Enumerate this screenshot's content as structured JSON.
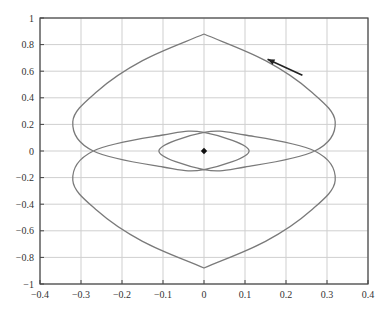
{
  "chart_data": {
    "type": "line",
    "title": "",
    "xlabel": "",
    "ylabel": "",
    "xlim": [
      -0.4,
      0.4
    ],
    "ylim": [
      -1,
      1
    ],
    "grid": true,
    "legend": null,
    "x_ticks": [
      "-0.4",
      "-0.3",
      "-0.2",
      "-0.1",
      "0",
      "0.1",
      "0.2",
      "0.3",
      "0.4"
    ],
    "y_ticks": [
      "1",
      "0.8",
      "0.6",
      "0.4",
      "0.2",
      "0",
      "-0.2",
      "-0.4",
      "-0.6",
      "-0.8",
      "-1"
    ],
    "series": [
      {
        "name": "trajectory",
        "description": "Closed phase-plane trajectory: upper lobe, lower lobe and inner ellipse around the origin",
        "points": [
          {
            "x": 0.0,
            "y": 0.88
          },
          {
            "x": 0.15,
            "y": 0.68
          },
          {
            "x": 0.26,
            "y": 0.45
          },
          {
            "x": 0.32,
            "y": 0.22
          },
          {
            "x": 0.27,
            "y": 0.0
          },
          {
            "x": 0.1,
            "y": -0.12
          },
          {
            "x": 0.0,
            "y": -0.14
          },
          {
            "x": -0.11,
            "y": 0.0
          },
          {
            "x": 0.0,
            "y": 0.14
          },
          {
            "x": 0.1,
            "y": 0.12
          },
          {
            "x": 0.27,
            "y": 0.0
          },
          {
            "x": 0.32,
            "y": -0.22
          },
          {
            "x": 0.26,
            "y": -0.45
          },
          {
            "x": 0.15,
            "y": -0.68
          },
          {
            "x": 0.0,
            "y": -0.88
          },
          {
            "x": -0.15,
            "y": -0.68
          },
          {
            "x": -0.26,
            "y": -0.45
          },
          {
            "x": -0.32,
            "y": -0.22
          },
          {
            "x": -0.27,
            "y": 0.0
          },
          {
            "x": -0.1,
            "y": 0.12
          },
          {
            "x": 0.0,
            "y": 0.14
          },
          {
            "x": 0.11,
            "y": 0.0
          },
          {
            "x": 0.0,
            "y": -0.14
          },
          {
            "x": -0.1,
            "y": -0.12
          },
          {
            "x": -0.27,
            "y": 0.0
          },
          {
            "x": -0.32,
            "y": 0.22
          },
          {
            "x": -0.26,
            "y": 0.45
          },
          {
            "x": -0.15,
            "y": 0.68
          },
          {
            "x": 0.0,
            "y": 0.88
          }
        ],
        "color": "#7a7a7a"
      }
    ],
    "annotations": [
      {
        "type": "marker",
        "shape": "diamond",
        "x": 0.0,
        "y": 0.0,
        "color": "#111111"
      },
      {
        "type": "arrow",
        "from": {
          "x": 0.24,
          "y": 0.57
        },
        "to": {
          "x": 0.155,
          "y": 0.69
        },
        "color": "#222222"
      }
    ]
  }
}
